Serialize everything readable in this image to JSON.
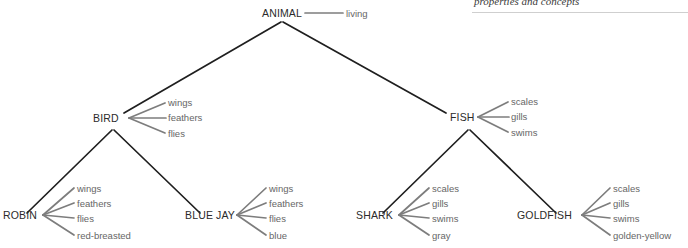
{
  "figure": {
    "caption": "properties and concepts",
    "background_color": "#ffffff",
    "hierarchy_edge_color": "#1f1f1f",
    "property_edge_color": "#7d7d7d",
    "node_text_color": "#2b2b2b",
    "property_text_color": "#666666",
    "rule_color": "#cfcfcf"
  },
  "nodes": {
    "animal": {
      "label": "ANIMAL"
    },
    "bird": {
      "label": "BIRD"
    },
    "fish": {
      "label": "FISH"
    },
    "robin": {
      "label": "ROBIN"
    },
    "blue_jay": {
      "label": "BLUE JAY"
    },
    "shark": {
      "label": "SHARK"
    },
    "goldfish": {
      "label": "GOLDFISH"
    }
  },
  "properties": {
    "animal": [
      "living"
    ],
    "bird": [
      "wings",
      "feathers",
      "flies"
    ],
    "fish": [
      "scales",
      "gills",
      "swims"
    ],
    "robin": [
      "wings",
      "feathers",
      "flies",
      "red-breasted"
    ],
    "blue_jay": [
      "wings",
      "feathers",
      "flies",
      "blue"
    ],
    "shark": [
      "scales",
      "gills",
      "swims",
      "gray"
    ],
    "goldfish": [
      "scales",
      "gills",
      "swims",
      "golden-yellow"
    ]
  }
}
